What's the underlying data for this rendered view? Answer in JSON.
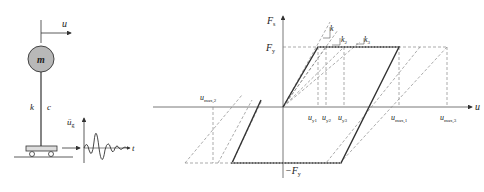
{
  "sdof_model": {
    "displacement_label": "u",
    "mass_label": "m",
    "stiffness_label": "k",
    "damping_label": "c",
    "ground_accel_label": "ü",
    "ground_accel_sub": "g",
    "time_label": "t"
  },
  "hysteresis": {
    "y_axis_label": "F",
    "y_axis_sub": "s",
    "x_axis_label": "u",
    "yield_force_label": "F",
    "yield_force_sub": "y",
    "neg_yield_force_label": "−F",
    "neg_yield_force_sub": "y",
    "stiffness_labels": [
      {
        "label": "k",
        "sub": ""
      },
      {
        "label": "k",
        "sub": "2"
      },
      {
        "label": "k",
        "sub": "3"
      }
    ],
    "yield_disp_labels": [
      {
        "label": "u",
        "sub": "y1"
      },
      {
        "label": "u",
        "sub": "y2"
      },
      {
        "label": "u",
        "sub": "y3"
      }
    ],
    "max_disp_labels": [
      {
        "label": "u",
        "sub": "max,1"
      },
      {
        "label": "u",
        "sub": "max,2"
      },
      {
        "label": "u",
        "sub": "max,3"
      }
    ],
    "colors": {
      "bold_loop": "#333333",
      "dashed": "#888888"
    }
  }
}
